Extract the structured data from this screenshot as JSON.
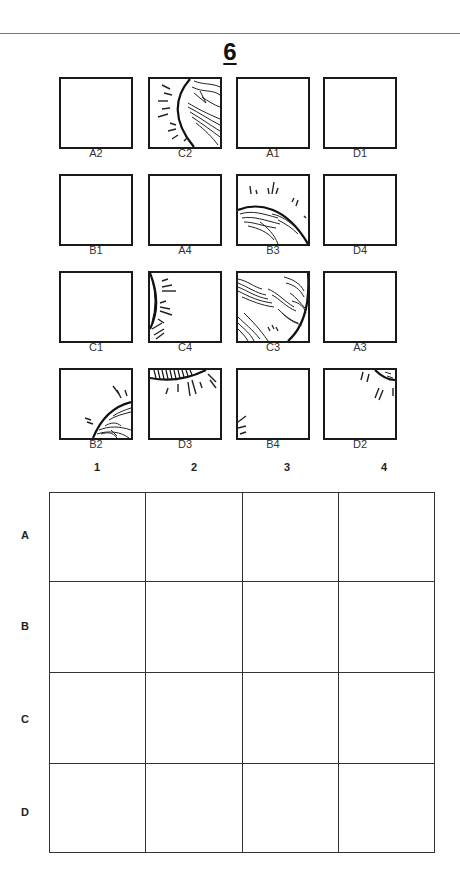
{
  "page": {
    "number": "6"
  },
  "tiles": [
    {
      "label": "A2",
      "art": "none"
    },
    {
      "label": "C2",
      "art": "c2"
    },
    {
      "label": "A1",
      "art": "none"
    },
    {
      "label": "D1",
      "art": "none"
    },
    {
      "label": "B1",
      "art": "none"
    },
    {
      "label": "A4",
      "art": "none"
    },
    {
      "label": "B3",
      "art": "b3"
    },
    {
      "label": "D4",
      "art": "none"
    },
    {
      "label": "C1",
      "art": "none"
    },
    {
      "label": "C4",
      "art": "c4"
    },
    {
      "label": "C3",
      "art": "c3"
    },
    {
      "label": "A3",
      "art": "none"
    },
    {
      "label": "B2",
      "art": "b2"
    },
    {
      "label": "D3",
      "art": "d3"
    },
    {
      "label": "B4",
      "art": "b4"
    },
    {
      "label": "D2",
      "art": "d2"
    }
  ],
  "grid": {
    "columns": [
      "1",
      "2",
      "3",
      "4"
    ],
    "rows": [
      "A",
      "B",
      "C",
      "D"
    ],
    "cells": [
      [
        "",
        "",
        "",
        ""
      ],
      [
        "",
        "",
        "",
        ""
      ],
      [
        "",
        "",
        "",
        ""
      ],
      [
        "",
        "",
        "",
        ""
      ]
    ]
  },
  "colors": {
    "line": "#1a1a1a",
    "background": "#ffffff"
  }
}
